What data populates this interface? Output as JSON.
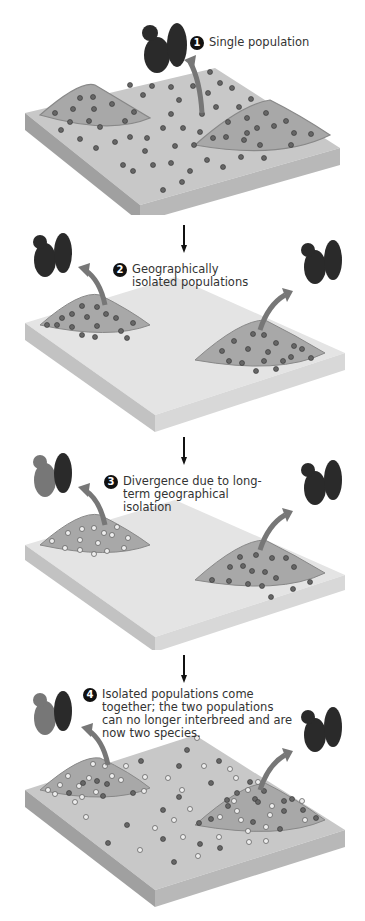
{
  "diagram": {
    "steps": [
      {
        "number": "1",
        "label": "Single population"
      },
      {
        "number": "2",
        "label": "Geographically isolated populations"
      },
      {
        "number": "3",
        "label": "Divergence due to long-term geographical isolation"
      },
      {
        "number": "4",
        "label": "Isolated populations come together; the two populations can no longer interbreed and are now two species."
      }
    ],
    "colors": {
      "land_top": "#c8c8c8",
      "land_side_dark": "#9a9a9a",
      "land_side_light": "#b5b5b5",
      "water": "#e6e6e6",
      "mound": "#a8a8a8",
      "dot_dark": "#666666",
      "dot_light": "#eeeeee",
      "arrow": "#777777",
      "squirrel": "#2a2a2a"
    }
  }
}
